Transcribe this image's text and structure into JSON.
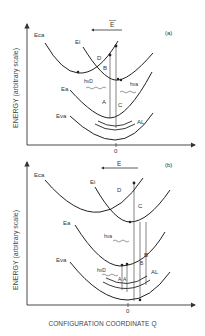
{
  "panels": [
    {
      "tag": "(a)",
      "field_label": "E",
      "ylabel": "ENERGY (arbitrary scale)",
      "origin_tick": "0",
      "curves": [
        "Eca",
        "Ei",
        "Ea",
        "Eva"
      ],
      "transitions": [
        "D",
        "B",
        "A",
        "C",
        "AL"
      ],
      "photons": [
        "hνD",
        "hνa"
      ]
    },
    {
      "tag": "(b)",
      "field_label": "E",
      "ylabel": "ENERGY (arbitrary scale)",
      "origin_tick": "0",
      "curves": [
        "Eca",
        "Ei",
        "Ea",
        "Eva"
      ],
      "transitions": [
        "D",
        "C",
        "B",
        "B",
        "A",
        "A",
        "AL"
      ],
      "photons": [
        "hνa",
        "hνD"
      ]
    }
  ],
  "xlabel": "CONFIGURATION COORDINATE Q"
}
